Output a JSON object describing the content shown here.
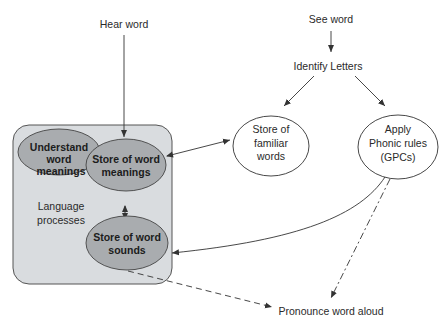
{
  "diagram": {
    "colors": {
      "container_fill": "#d9dcdf",
      "container_stroke": "#555555",
      "ellipse_dark_fill": "#a9acaf",
      "ellipse_light_fill": "#ffffff",
      "line": "#333333",
      "text": "#2a2a2a"
    },
    "nodes": {
      "hear_word": {
        "label": "Hear word"
      },
      "see_word": {
        "label": "See word"
      },
      "identify_letters": {
        "label": "Identify Letters"
      },
      "understand": {
        "lines": [
          "Understand",
          "word",
          "meanings"
        ]
      },
      "store_meanings": {
        "lines": [
          "Store of word",
          "meanings"
        ]
      },
      "language_processes": {
        "lines": [
          "Language",
          "processes"
        ]
      },
      "store_sounds": {
        "lines": [
          "Store of word",
          "sounds"
        ]
      },
      "familiar_words": {
        "lines": [
          "Store of",
          "familiar",
          "words"
        ]
      },
      "phonic_rules": {
        "lines": [
          "Apply",
          "Phonic rules",
          "(GPCs)"
        ]
      },
      "pronounce": {
        "label": "Pronounce word aloud"
      }
    },
    "edges": [
      {
        "from": "Hear word",
        "to": "Store of word meanings",
        "style": "solid"
      },
      {
        "from": "See word",
        "to": "Identify Letters",
        "style": "solid"
      },
      {
        "from": "Identify Letters",
        "to": "Store of familiar words",
        "style": "solid"
      },
      {
        "from": "Identify Letters",
        "to": "Apply Phonic rules (GPCs)",
        "style": "solid"
      },
      {
        "from": "Store of familiar words",
        "to": "Store of word meanings",
        "style": "solid",
        "bidirectional": true
      },
      {
        "from": "Store of word meanings",
        "to": "Store of word sounds",
        "style": "solid",
        "bidirectional": true
      },
      {
        "from": "Apply Phonic rules (GPCs)",
        "to": "Store of word sounds",
        "style": "solid"
      },
      {
        "from": "Apply Phonic rules (GPCs)",
        "to": "Pronounce word aloud",
        "style": "dashed"
      },
      {
        "from": "Store of word sounds",
        "to": "Pronounce word aloud",
        "style": "dashed"
      }
    ]
  }
}
